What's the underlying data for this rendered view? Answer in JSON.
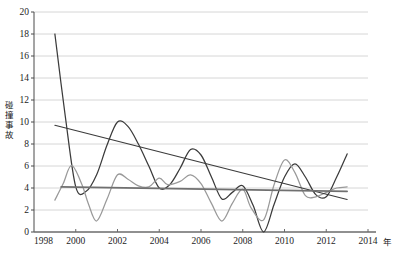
{
  "chart_data": {
    "type": "line",
    "title": "",
    "xlabel": "年",
    "ylabel": "碰撞事故",
    "xlim": [
      1998,
      2014
    ],
    "ylim": [
      0,
      20
    ],
    "grid": true,
    "legend_position": "none",
    "x_ticks": [
      "1998",
      "2000",
      "2002",
      "2004",
      "2006",
      "2008",
      "2010",
      "2012",
      "2014"
    ],
    "y_ticks": [
      "0",
      "2",
      "4",
      "6",
      "8",
      "10",
      "12",
      "14",
      "16",
      "18",
      "20"
    ],
    "series": [
      {
        "name": "碰撞事故（深色曲线）",
        "color": "#3b3b3b",
        "style": "smooth-curve",
        "x": [
          1999,
          1999.5,
          2000,
          2000.5,
          2001,
          2001.5,
          2002,
          2002.5,
          2003,
          2003.5,
          2004,
          2004.5,
          2005,
          2005.5,
          2006,
          2006.5,
          2007,
          2007.5,
          2008,
          2008.5,
          2009,
          2009.5,
          2010,
          2010.5,
          2011,
          2011.5,
          2012,
          2012.5,
          2013
        ],
        "values": [
          18,
          10.5,
          4.1,
          3.7,
          5.2,
          7.9,
          10.0,
          9.6,
          8.0,
          6.0,
          4.0,
          4.3,
          5.8,
          7.5,
          7.0,
          5.0,
          3.0,
          3.6,
          4.2,
          2.4,
          0.0,
          2.5,
          5.0,
          6.2,
          5.0,
          3.4,
          3.2,
          5.0,
          7.1
        ]
      },
      {
        "name": "碰撞事故（浅色曲线）",
        "color": "#999999",
        "style": "smooth-curve",
        "x": [
          1999,
          1999.4,
          1999.8,
          2000.3,
          2000.6,
          2001,
          2001.5,
          2002,
          2002.5,
          2003,
          2003.5,
          2004,
          2004.4,
          2005,
          2005.5,
          2006,
          2006.5,
          2007,
          2007.5,
          2008,
          2008.4,
          2009,
          2009.5,
          2010,
          2010.5,
          2011,
          2011.5,
          2012,
          2012.5,
          2013
        ],
        "values": [
          2.9,
          4.4,
          6.05,
          4.3,
          2.6,
          1.0,
          3.0,
          5.2,
          4.8,
          4.2,
          4.1,
          4.9,
          4.3,
          4.6,
          5.2,
          4.4,
          2.6,
          1.0,
          2.6,
          3.9,
          2.2,
          1.1,
          4.3,
          6.55,
          5.4,
          3.3,
          3.2,
          3.6,
          4.0,
          4.1
        ]
      }
    ],
    "trendlines": [
      {
        "name": "下降趋势线",
        "color": "#3b3b3b",
        "style": "straight",
        "x": [
          1999,
          2013
        ],
        "values": [
          9.7,
          2.95
        ]
      },
      {
        "name": "近水平趋势线",
        "color": "#707070",
        "style": "straight",
        "x": [
          1999.3,
          2013
        ],
        "values": [
          4.1,
          3.7
        ]
      }
    ]
  }
}
